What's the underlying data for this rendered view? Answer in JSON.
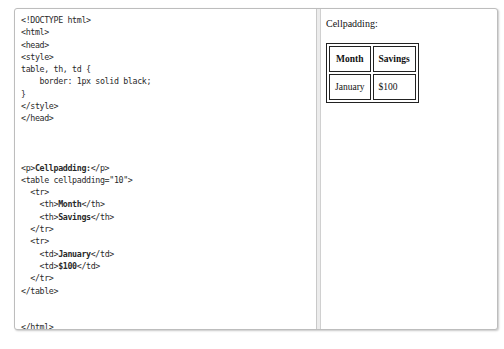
{
  "editor": {
    "lines": [
      {
        "text": "<!DOCTYPE html>"
      },
      {
        "text": "<html>"
      },
      {
        "text": "<head>"
      },
      {
        "text": "<style>"
      },
      {
        "text": "table, th, td {"
      },
      {
        "text": "    border: 1px solid black;"
      },
      {
        "text": "}"
      },
      {
        "text": "</style>"
      },
      {
        "text": "</head>"
      },
      {
        "text": ""
      },
      {
        "text": ""
      },
      {
        "text": ""
      },
      {
        "pre": "<p>",
        "bold": "Cellpadding:",
        "post": "</p>"
      },
      {
        "text": "<table cellpadding=\"10\">"
      },
      {
        "text": "  <tr>"
      },
      {
        "pre": "    <th>",
        "bold": "Month",
        "post": "</th>"
      },
      {
        "pre": "    <th>",
        "bold": "Savings",
        "post": "</th>"
      },
      {
        "text": "  </tr>"
      },
      {
        "text": "  <tr>"
      },
      {
        "pre": "    <td>",
        "bold": "January",
        "post": "</td>"
      },
      {
        "pre": "    <td>",
        "bold": "$100",
        "post": "</td>"
      },
      {
        "text": "  </tr>"
      },
      {
        "text": "</table>"
      },
      {
        "text": ""
      },
      {
        "text": ""
      },
      {
        "text": "</html>"
      }
    ]
  },
  "result": {
    "paragraph": "Cellpadding:",
    "table": {
      "headers": [
        "Month",
        "Savings"
      ],
      "rows": [
        [
          "January",
          "$100"
        ]
      ]
    }
  }
}
